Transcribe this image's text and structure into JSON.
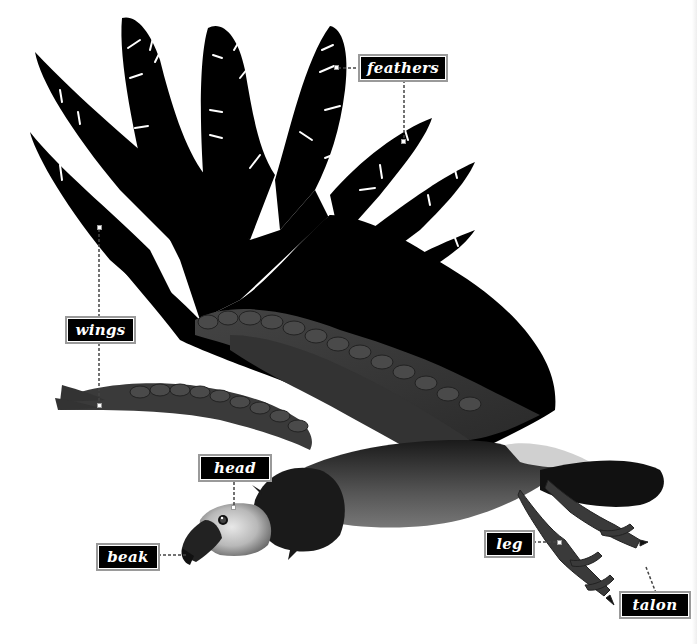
{
  "diagram": {
    "labels": [
      {
        "id": "feathers",
        "text": "feathers"
      },
      {
        "id": "wings",
        "text": "wings"
      },
      {
        "id": "head",
        "text": "head"
      },
      {
        "id": "beak",
        "text": "beak"
      },
      {
        "id": "leg",
        "text": "leg"
      },
      {
        "id": "talon",
        "text": "talon"
      }
    ]
  },
  "colors": {
    "label_bg": "#000000",
    "label_text": "#ffffff",
    "label_border": "#9a9a9a",
    "wing_primary": "#000000",
    "covert_feathers": "#3a3a3a",
    "background": "#ffffff"
  }
}
